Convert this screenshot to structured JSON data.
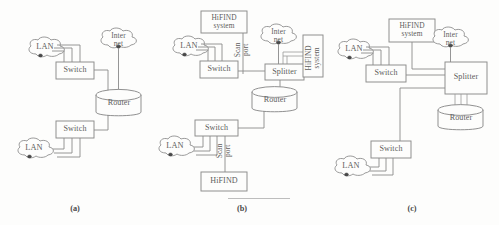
{
  "figure": {
    "background_color": "#fdfdfc",
    "line_color": "#8a8a8a",
    "text_color": "#5d5d5d",
    "width": 499,
    "height": 225
  },
  "captions": {
    "a": "(a)",
    "b": "(b)",
    "c": "(c)"
  },
  "labels": {
    "lan": "LAN",
    "switch": "Switch",
    "router": "Router",
    "splitter": "Splitter",
    "internet_line1": "Inter",
    "internet_line2": "net",
    "hifind_line1": "HiFIND",
    "hifind_line2": "system",
    "hifind_plain": "HiFIND",
    "scan_line1": "Scan",
    "scan_line2": "port"
  },
  "panels": {
    "a": {
      "caption": "(a)",
      "nodes": [
        {
          "id": "lan-top",
          "type": "cloud",
          "label": "LAN"
        },
        {
          "id": "switch-top",
          "type": "box",
          "label": "Switch"
        },
        {
          "id": "internet",
          "type": "cloud",
          "label": "Inter net"
        },
        {
          "id": "router",
          "type": "cylinder",
          "label": "Router"
        },
        {
          "id": "switch-bottom",
          "type": "box",
          "label": "Switch"
        },
        {
          "id": "lan-bottom",
          "type": "cloud",
          "label": "LAN"
        }
      ],
      "links": [
        {
          "from": "lan-top",
          "to": "switch-top",
          "count": 3
        },
        {
          "from": "switch-top",
          "to": "router",
          "count": 1
        },
        {
          "from": "internet",
          "to": "router",
          "count": 1
        },
        {
          "from": "router",
          "to": "switch-bottom",
          "count": 1
        },
        {
          "from": "switch-bottom",
          "to": "lan-bottom",
          "count": 3
        }
      ]
    },
    "b": {
      "caption": "(b)",
      "nodes": [
        {
          "id": "hifind-top",
          "type": "box",
          "label": "HiFIND system"
        },
        {
          "id": "lan-top",
          "type": "cloud",
          "label": "LAN"
        },
        {
          "id": "switch-top",
          "type": "box",
          "label": "Switch"
        },
        {
          "id": "internet",
          "type": "cloud",
          "label": "Inter net"
        },
        {
          "id": "splitter",
          "type": "box",
          "label": "Splitter"
        },
        {
          "id": "hifind-right",
          "type": "box-vertical",
          "label": "HiFIND system"
        },
        {
          "id": "router",
          "type": "cylinder",
          "label": "Router"
        },
        {
          "id": "switch-bottom",
          "type": "box",
          "label": "Switch"
        },
        {
          "id": "lan-bottom",
          "type": "cloud",
          "label": "LAN"
        },
        {
          "id": "hifind-bottom",
          "type": "box",
          "label": "HiFIND"
        }
      ],
      "links": [
        {
          "from": "hifind-top",
          "to": "switch-top",
          "count": 1,
          "label": "Scan port"
        },
        {
          "from": "lan-top",
          "to": "switch-top",
          "count": 3
        },
        {
          "from": "switch-top",
          "to": "splitter",
          "count": 1
        },
        {
          "from": "internet",
          "to": "splitter",
          "count": 1
        },
        {
          "from": "splitter",
          "to": "hifind-right",
          "count": 2
        },
        {
          "from": "splitter",
          "to": "router",
          "count": 1
        },
        {
          "from": "router",
          "to": "switch-bottom",
          "count": 1
        },
        {
          "from": "lan-bottom",
          "to": "switch-bottom",
          "count": 3
        },
        {
          "from": "switch-bottom",
          "to": "hifind-bottom",
          "count": 1,
          "label": "Scan port"
        }
      ]
    },
    "c": {
      "caption": "(c)",
      "nodes": [
        {
          "id": "hifind-top",
          "type": "box",
          "label": "HiFIND system"
        },
        {
          "id": "internet",
          "type": "cloud",
          "label": "Inter net"
        },
        {
          "id": "lan-top",
          "type": "cloud",
          "label": "LAN"
        },
        {
          "id": "switch-top",
          "type": "box",
          "label": "Switch"
        },
        {
          "id": "splitter",
          "type": "box",
          "label": "Splitter"
        },
        {
          "id": "router",
          "type": "cylinder",
          "label": "Router"
        },
        {
          "id": "switch-bottom",
          "type": "box",
          "label": "Switch"
        },
        {
          "id": "lan-bottom",
          "type": "cloud",
          "label": "LAN"
        }
      ],
      "links": [
        {
          "from": "hifind-top",
          "to": "splitter",
          "count": 1
        },
        {
          "from": "internet",
          "to": "splitter",
          "count": 1
        },
        {
          "from": "lan-top",
          "to": "switch-top",
          "count": 3
        },
        {
          "from": "switch-top",
          "to": "splitter",
          "count": 1
        },
        {
          "from": "splitter",
          "to": "router",
          "count": 3
        },
        {
          "from": "splitter",
          "to": "switch-bottom",
          "count": 1
        },
        {
          "from": "lan-bottom",
          "to": "switch-bottom",
          "count": 3
        }
      ]
    }
  }
}
